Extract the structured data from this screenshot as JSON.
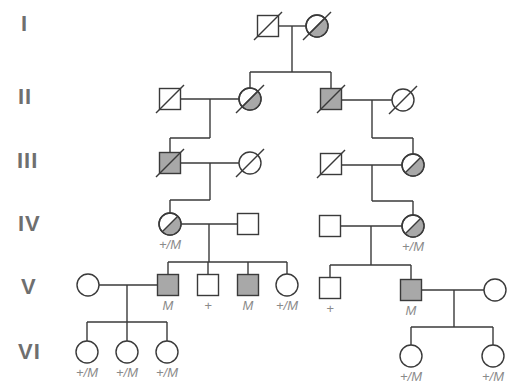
{
  "colors": {
    "line": "#3a3a3a",
    "affected_fill": "#a8a8a8",
    "unaffected_fill": "#ffffff",
    "generation_label": "#6f6f6f",
    "genotype_label": "#8a8a8a"
  },
  "generations": [
    {
      "label": "I",
      "y": 24
    },
    {
      "label": "II",
      "y": 97
    },
    {
      "label": "III",
      "y": 161
    },
    {
      "label": "IV",
      "y": 224
    },
    {
      "label": "V",
      "y": 287
    },
    {
      "label": "VI",
      "y": 352
    }
  ],
  "individuals": [
    {
      "id": "I-1",
      "sex": "male",
      "status": "unaffected",
      "deceased": true,
      "x": 268,
      "y": 26,
      "genotype": ""
    },
    {
      "id": "I-2",
      "sex": "female",
      "status": "half",
      "deceased": true,
      "x": 317,
      "y": 26,
      "genotype": ""
    },
    {
      "id": "II-1",
      "sex": "male",
      "status": "unaffected",
      "deceased": true,
      "x": 170,
      "y": 99,
      "genotype": ""
    },
    {
      "id": "II-2",
      "sex": "female",
      "status": "half",
      "deceased": true,
      "x": 250,
      "y": 99,
      "genotype": ""
    },
    {
      "id": "II-3",
      "sex": "male",
      "status": "affected",
      "deceased": true,
      "x": 331,
      "y": 99,
      "genotype": ""
    },
    {
      "id": "II-4",
      "sex": "female",
      "status": "unaffected",
      "deceased": true,
      "x": 403,
      "y": 100,
      "genotype": ""
    },
    {
      "id": "III-1",
      "sex": "male",
      "status": "affected",
      "deceased": true,
      "x": 170,
      "y": 163,
      "genotype": ""
    },
    {
      "id": "III-2",
      "sex": "female",
      "status": "unaffected",
      "deceased": true,
      "x": 250,
      "y": 163,
      "genotype": ""
    },
    {
      "id": "III-3",
      "sex": "male",
      "status": "unaffected",
      "deceased": true,
      "x": 331,
      "y": 164,
      "genotype": ""
    },
    {
      "id": "III-4",
      "sex": "female",
      "status": "half",
      "deceased": false,
      "x": 413,
      "y": 165,
      "genotype": ""
    },
    {
      "id": "IV-1",
      "sex": "female",
      "status": "half",
      "deceased": false,
      "x": 170,
      "y": 224,
      "genotype": "+/M"
    },
    {
      "id": "IV-2",
      "sex": "male",
      "status": "unaffected",
      "deceased": false,
      "x": 248,
      "y": 224,
      "genotype": ""
    },
    {
      "id": "IV-3",
      "sex": "male",
      "status": "unaffected",
      "deceased": false,
      "x": 330,
      "y": 226,
      "genotype": ""
    },
    {
      "id": "IV-4",
      "sex": "female",
      "status": "half",
      "deceased": false,
      "x": 413,
      "y": 226,
      "genotype": "+/M"
    },
    {
      "id": "V-1",
      "sex": "female",
      "status": "unaffected",
      "deceased": false,
      "x": 88,
      "y": 285,
      "genotype": ""
    },
    {
      "id": "V-2",
      "sex": "male",
      "status": "affected",
      "deceased": false,
      "x": 168,
      "y": 285,
      "genotype": "M"
    },
    {
      "id": "V-3",
      "sex": "male",
      "status": "unaffected",
      "deceased": false,
      "x": 208,
      "y": 285,
      "genotype": "+"
    },
    {
      "id": "V-4",
      "sex": "male",
      "status": "affected",
      "deceased": false,
      "x": 248,
      "y": 285,
      "genotype": "M"
    },
    {
      "id": "V-5",
      "sex": "female",
      "status": "unaffected",
      "deceased": false,
      "x": 287,
      "y": 285,
      "genotype": "+/M"
    },
    {
      "id": "V-6",
      "sex": "male",
      "status": "unaffected",
      "deceased": false,
      "x": 330,
      "y": 288,
      "genotype": "+"
    },
    {
      "id": "V-7",
      "sex": "male",
      "status": "affected",
      "deceased": false,
      "x": 411,
      "y": 290,
      "genotype": "M"
    },
    {
      "id": "V-8",
      "sex": "female",
      "status": "unaffected",
      "deceased": false,
      "x": 495,
      "y": 290,
      "genotype": ""
    },
    {
      "id": "VI-1",
      "sex": "female",
      "status": "unaffected",
      "deceased": false,
      "x": 87,
      "y": 352,
      "genotype": "+/M"
    },
    {
      "id": "VI-2",
      "sex": "female",
      "status": "unaffected",
      "deceased": false,
      "x": 127,
      "y": 352,
      "genotype": "+/M"
    },
    {
      "id": "VI-3",
      "sex": "female",
      "status": "unaffected",
      "deceased": false,
      "x": 167,
      "y": 352,
      "genotype": "+/M"
    },
    {
      "id": "VI-4",
      "sex": "female",
      "status": "unaffected",
      "deceased": false,
      "x": 411,
      "y": 356,
      "genotype": "+/M"
    },
    {
      "id": "VI-5",
      "sex": "female",
      "status": "unaffected",
      "deceased": false,
      "x": 493,
      "y": 356,
      "genotype": "+/M"
    }
  ],
  "lines": [
    [
      279,
      26,
      306,
      26
    ],
    [
      292,
      26,
      292,
      72
    ],
    [
      250,
      72,
      331,
      72
    ],
    [
      250,
      72,
      250,
      88
    ],
    [
      331,
      72,
      331,
      88
    ],
    [
      181,
      99,
      239,
      99
    ],
    [
      210,
      99,
      210,
      138
    ],
    [
      170,
      138,
      210,
      138
    ],
    [
      170,
      138,
      170,
      152
    ],
    [
      342,
      100,
      392,
      100
    ],
    [
      372,
      100,
      372,
      138
    ],
    [
      372,
      138,
      413,
      138
    ],
    [
      413,
      138,
      413,
      154
    ],
    [
      181,
      163,
      239,
      163
    ],
    [
      210,
      163,
      210,
      200
    ],
    [
      170,
      200,
      210,
      200
    ],
    [
      170,
      200,
      170,
      213
    ],
    [
      342,
      165,
      402,
      165
    ],
    [
      372,
      165,
      372,
      201
    ],
    [
      372,
      201,
      413,
      201
    ],
    [
      413,
      201,
      413,
      215
    ],
    [
      181,
      224,
      238,
      224
    ],
    [
      209,
      224,
      209,
      262
    ],
    [
      168,
      262,
      287,
      262
    ],
    [
      168,
      262,
      168,
      274
    ],
    [
      208,
      262,
      208,
      274
    ],
    [
      248,
      262,
      248,
      274
    ],
    [
      287,
      262,
      287,
      274
    ],
    [
      341,
      226,
      402,
      226
    ],
    [
      371,
      226,
      371,
      265
    ],
    [
      330,
      265,
      411,
      265
    ],
    [
      330,
      265,
      330,
      277
    ],
    [
      411,
      265,
      411,
      279
    ],
    [
      99,
      285,
      157,
      285
    ],
    [
      127,
      285,
      127,
      322
    ],
    [
      87,
      322,
      167,
      322
    ],
    [
      87,
      322,
      87,
      341
    ],
    [
      127,
      322,
      127,
      341
    ],
    [
      167,
      322,
      167,
      341
    ],
    [
      422,
      290,
      484,
      290
    ],
    [
      454,
      290,
      454,
      327
    ],
    [
      411,
      327,
      493,
      327
    ],
    [
      411,
      327,
      411,
      345
    ],
    [
      493,
      327,
      493,
      345
    ]
  ]
}
